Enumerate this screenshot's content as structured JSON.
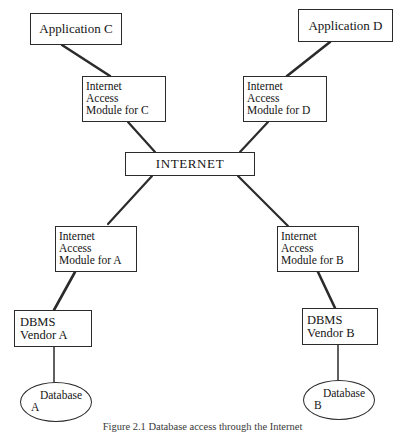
{
  "figure": {
    "caption": "Figure 2.1  Database access through the Internet",
    "width": 405,
    "height": 433,
    "background_color": "#ffffff",
    "line_color": "#2b2b2b",
    "text_color": "#141414"
  },
  "nodes": {
    "application_c": {
      "label": "Application C"
    },
    "application_d": {
      "label": "Application D"
    },
    "iam_c": {
      "line1": "Internet",
      "line2": "Access",
      "line3": "Module for C"
    },
    "iam_d": {
      "line1": "Internet",
      "line2": "Access",
      "line3": "Module for D"
    },
    "internet": {
      "label": "INTERNET"
    },
    "iam_a": {
      "line1": "Internet",
      "line2": "Access",
      "line3": "Module for A"
    },
    "iam_b": {
      "line1": "Internet",
      "line2": "Access",
      "line3": "Module for B"
    },
    "dbms_a": {
      "line1": "DBMS",
      "line2": "Vendor A"
    },
    "dbms_b": {
      "line1": "DBMS",
      "line2": "Vendor B"
    },
    "database_a": {
      "line1": "Database",
      "line2": "A"
    },
    "database_b": {
      "line1": "Database",
      "line2": "B"
    }
  }
}
